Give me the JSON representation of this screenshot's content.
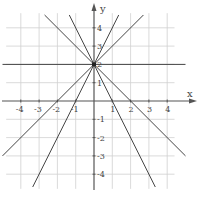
{
  "diagram": {
    "type": "coordinate-plane",
    "x_axis_label": "x",
    "y_axis_label": "y",
    "x_ticks": [
      {
        "value": -4,
        "label": "-4"
      },
      {
        "value": -3,
        "label": "-3"
      },
      {
        "value": -2,
        "label": "-2"
      },
      {
        "value": -1,
        "label": "-1"
      },
      {
        "value": 1,
        "label": "1"
      },
      {
        "value": 2,
        "label": "2"
      },
      {
        "value": 3,
        "label": "3"
      },
      {
        "value": 4,
        "label": "4"
      }
    ],
    "y_ticks": [
      {
        "value": 4,
        "label": "4"
      },
      {
        "value": 3,
        "label": "3"
      },
      {
        "value": 2,
        "label": "2"
      },
      {
        "value": 1,
        "label": "1"
      },
      {
        "value": -1,
        "label": "-1"
      },
      {
        "value": -2,
        "label": "-2"
      },
      {
        "value": -3,
        "label": "-3"
      },
      {
        "value": -4,
        "label": "-4"
      }
    ],
    "common_point": {
      "x": 0,
      "y": 2
    },
    "lines": [
      {
        "name": "y=2",
        "slope": 0,
        "intercept": 2,
        "x_from": -5,
        "x_to": 5
      },
      {
        "name": "y=x+2",
        "slope": 1,
        "intercept": 2,
        "x_from": -5,
        "x_to": 2.7
      },
      {
        "name": "y=-x+2",
        "slope": -1,
        "intercept": 2,
        "x_from": -2.7,
        "x_to": 5
      },
      {
        "name": "y=2x+2",
        "slope": 2,
        "intercept": 2,
        "x_from": -3.35,
        "x_to": 1.35
      },
      {
        "name": "y=-2x+2",
        "slope": -2,
        "intercept": 2,
        "x_from": -1.35,
        "x_to": 3.35
      }
    ],
    "colors": {
      "grid": "#d0d0d0",
      "axis": "#555555",
      "line": "#444444"
    }
  }
}
